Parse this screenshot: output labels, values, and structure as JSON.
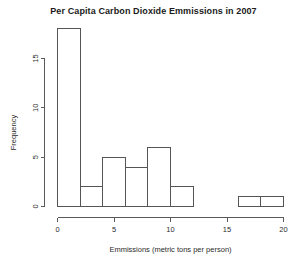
{
  "chart_data": {
    "type": "bar",
    "title": "Per Capita Carbon Dioxide Emmissions in 2007",
    "xlabel": "Emmissions (metric tons per person)",
    "ylabel": "Frequency",
    "subtitle": "",
    "grid": false,
    "legend": "none",
    "bin_width": 2,
    "xlim": [
      0,
      20
    ],
    "ylim": [
      0,
      18
    ],
    "xticks": [
      0,
      5,
      10,
      15,
      20
    ],
    "xticklabels": [
      "0",
      "5",
      "10",
      "15",
      "20"
    ],
    "yticks": [
      0,
      5,
      10,
      15
    ],
    "yticklabels": [
      "0",
      "5",
      "10",
      "15"
    ],
    "bin_edges": [
      0,
      2,
      4,
      6,
      8,
      10,
      12,
      14,
      16,
      18,
      20
    ],
    "categories": [
      "0-2",
      "2-4",
      "4-6",
      "6-8",
      "8-10",
      "10-12",
      "12-14",
      "14-16",
      "16-18",
      "18-20"
    ],
    "values": [
      18,
      2,
      5,
      4,
      6,
      2,
      0,
      0,
      1,
      1
    ],
    "bars": [
      {
        "x0": 0,
        "x1": 2,
        "value": 18
      },
      {
        "x0": 2,
        "x1": 4,
        "value": 2
      },
      {
        "x0": 4,
        "x1": 6,
        "value": 5
      },
      {
        "x0": 6,
        "x1": 8,
        "value": 4
      },
      {
        "x0": 8,
        "x1": 10,
        "value": 6
      },
      {
        "x0": 10,
        "x1": 12,
        "value": 2
      },
      {
        "x0": 12,
        "x1": 14,
        "value": 0
      },
      {
        "x0": 14,
        "x1": 16,
        "value": 0
      },
      {
        "x0": 16,
        "x1": 18,
        "value": 1
      },
      {
        "x0": 18,
        "x1": 20,
        "value": 1
      }
    ],
    "colors": {
      "bar_fill": "#ffffff",
      "bar_stroke": "#555555",
      "axis": "#5a5a5a",
      "text": "#2b2b2b",
      "title": "#1a1a1a",
      "background": "#ffffff"
    }
  }
}
